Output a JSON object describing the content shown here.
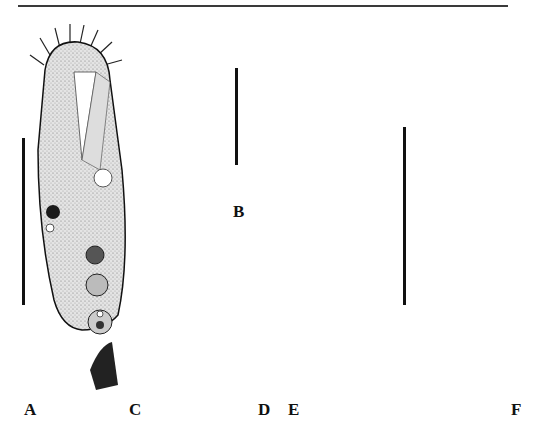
{
  "figure": {
    "panels": [
      {
        "id": "A",
        "label": "A",
        "description": "Ciliate cell, ventral view, stippled with cilia, oral region, vacuoles"
      },
      {
        "id": "B",
        "label": "B",
        "description": "Smaller ciliate cell, ventral view"
      },
      {
        "id": "C",
        "label": "C",
        "description": "Silver-impregnated cell, ventral side, light"
      },
      {
        "id": "D",
        "label": "D",
        "description": "Silver-impregnated cell, dorsal side, dark"
      },
      {
        "id": "E",
        "label": "E",
        "description": "Line drawing of infraciliature, ventral view with adoral zone membranelles"
      },
      {
        "id": "F",
        "label": "F",
        "description": "Line drawing, dorsal view with macronuclear nodules"
      }
    ],
    "scale_bars": [
      {
        "panel": "A",
        "x": 23,
        "y1": 138,
        "y2": 305
      },
      {
        "panel": "B",
        "x": 236,
        "y1": 68,
        "y2": 165
      },
      {
        "panel": "E-F",
        "x": 404,
        "y1": 127,
        "y2": 305
      }
    ],
    "colors": {
      "ink": "#111111",
      "stipple": "#cfcfcf",
      "rule": "#3a3a3a",
      "background": "#ffffff"
    }
  }
}
